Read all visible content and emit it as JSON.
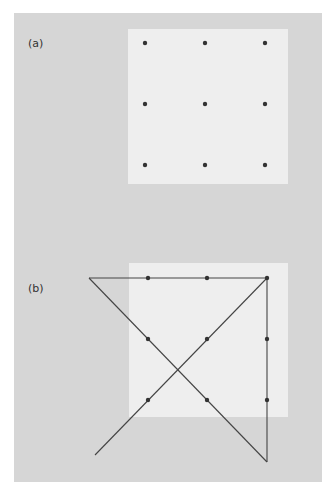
{
  "figure": {
    "panels": [
      {
        "label": "(a)",
        "description": "3x3 grid of dots on light square",
        "dots": [
          [
            145,
            43
          ],
          [
            205,
            43
          ],
          [
            265,
            43
          ],
          [
            145,
            104
          ],
          [
            205,
            104
          ],
          [
            265,
            104
          ],
          [
            145,
            165
          ],
          [
            205,
            165
          ],
          [
            265,
            165
          ]
        ]
      },
      {
        "label": "(b)",
        "description": "3x3 grid of dots connected by four straight lines extending beyond the square",
        "dots": [
          [
            148,
            278
          ],
          [
            207,
            278
          ],
          [
            267,
            278
          ],
          [
            148,
            339
          ],
          [
            207,
            339
          ],
          [
            267,
            339
          ],
          [
            148,
            400
          ],
          [
            207,
            400
          ],
          [
            267,
            400
          ]
        ],
        "lines": [
          [
            [
              89,
              278
            ],
            [
              267,
              278
            ]
          ],
          [
            [
              267,
              278
            ],
            [
              267,
              462
            ]
          ],
          [
            [
              267,
              462
            ],
            [
              89,
              278
            ]
          ],
          [
            [
              267,
              278
            ],
            [
              95,
              455
            ]
          ]
        ]
      }
    ],
    "colors": {
      "background": "#d6d6d6",
      "square": "#eeeeee",
      "dot": "#333333",
      "line": "#444444"
    }
  }
}
